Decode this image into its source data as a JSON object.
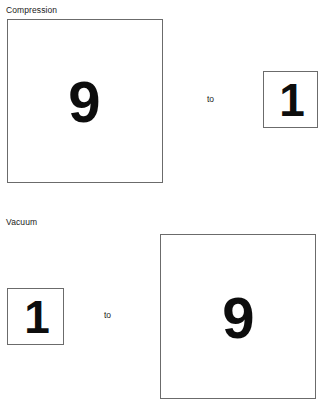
{
  "page": {
    "background_color": "#ffffff",
    "border_color": "#6b6b6b",
    "text_color": "#1a1a1a",
    "digit_color": "#0d0d0d"
  },
  "sections": [
    {
      "label": "Compression",
      "connector": "to",
      "from": {
        "value": "9",
        "size": "large"
      },
      "to": {
        "value": "1",
        "size": "small"
      }
    },
    {
      "label": "Vacuum",
      "connector": "to",
      "from": {
        "value": "1",
        "size": "small"
      },
      "to": {
        "value": "9",
        "size": "large"
      }
    }
  ]
}
